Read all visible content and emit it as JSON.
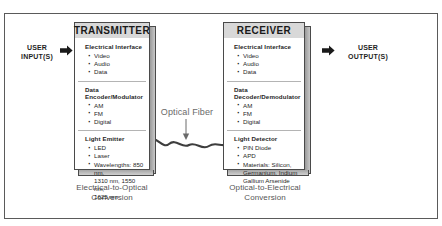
{
  "diagram": {
    "input": {
      "label_line1": "USER",
      "label_line2": "INPUT(S)",
      "arrow_icon": "right-arrow-icon"
    },
    "output": {
      "label_line1": "USER",
      "label_line2": "OUTPUT(S)",
      "arrow_icon": "right-arrow-icon"
    },
    "fiber": {
      "label": "Optical Fiber",
      "pointer_icon": "down-arrow-icon",
      "wave_icon": "wavy-line-icon"
    },
    "transmitter": {
      "title": "TRANSMITTER",
      "caption_line1": "Electrical-to-Optical",
      "caption_line2": "Conversion",
      "sections": [
        {
          "heading": "Electrical Interface",
          "items": [
            "Video",
            "Audio",
            "Data"
          ]
        },
        {
          "heading": "Data Encoder/Modulator",
          "items": [
            "AM",
            "FM",
            "Digital"
          ]
        },
        {
          "heading": "Light Emitter",
          "items": [
            "LED",
            "Laser",
            "Wavelengths: 850 nm,"
          ],
          "continuation": [
            "1310 nm, 1550 nm,",
            "1625 nm"
          ]
        }
      ]
    },
    "receiver": {
      "title": "RECEIVER",
      "caption_line1": "Optical-to-Electrical",
      "caption_line2": "Conversion",
      "sections": [
        {
          "heading": "Electrical Interface",
          "items": [
            "Video",
            "Audio",
            "Data"
          ]
        },
        {
          "heading": "Data Decoder/Demodulator",
          "items": [
            "AM",
            "FM",
            "Digital"
          ]
        },
        {
          "heading": "Light Detector",
          "items": [
            "PIN Diode",
            "APD",
            "Materials: Silicon,"
          ],
          "continuation": [
            "Germanium, Indium",
            "Gallium Arsenide"
          ]
        }
      ]
    },
    "colors": {
      "frame_border": "#5a5a5a",
      "box_border": "#4a4a4a",
      "title_band": "#d8d8d8",
      "bevel": "#b4b4b4",
      "caption_text": "#555555",
      "fiber_label": "#6a6a6a",
      "body_text": "#1f1f1f"
    }
  }
}
